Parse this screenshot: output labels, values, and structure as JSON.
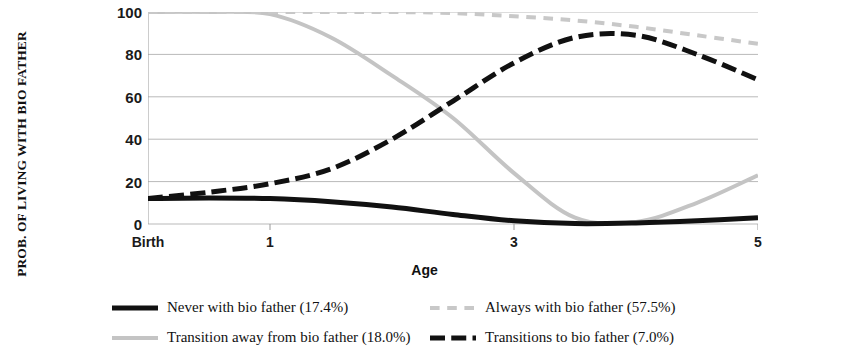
{
  "chart_data": {
    "type": "line",
    "title": "",
    "xlabel": "Age",
    "ylabel": "PROB. OF LIVING WITH BIO FATHER",
    "xlim": [
      0,
      5
    ],
    "ylim": [
      0,
      100
    ],
    "yticks": [
      100,
      80,
      60,
      40,
      20,
      0
    ],
    "xticks": [
      {
        "value": 0,
        "label": "Birth"
      },
      {
        "value": 1,
        "label": "1"
      },
      {
        "value": 3,
        "label": "3"
      },
      {
        "value": 5,
        "label": "5"
      }
    ],
    "grid": true,
    "legend_position": "bottom",
    "x": [
      0,
      0.5,
      1,
      1.5,
      2,
      2.5,
      3,
      3.5,
      4,
      4.5,
      5
    ],
    "series": [
      {
        "name": "Never with bio father (17.4%)",
        "label": "Never with bio father (17.4%)",
        "percent": "17.4%",
        "style": "solid",
        "color": "#111111",
        "width": 5,
        "values": [
          12,
          12.3,
          12,
          10.5,
          8,
          4.5,
          1.5,
          0.2,
          0.5,
          1.5,
          3
        ]
      },
      {
        "name": "Always with bio father (57.5%)",
        "label": "Always with bio father (57.5%)",
        "percent": "57.5%",
        "style": "dotted",
        "color": "#c8c8c8",
        "width": 4,
        "values": [
          100,
          100,
          100,
          100,
          100,
          99.5,
          98,
          96,
          93,
          89,
          85
        ]
      },
      {
        "name": "Transition away from bio father (18.0%)",
        "label": "Transition away from bio father (18.0%)",
        "percent": "18.0%",
        "style": "solid",
        "color": "#c4c4c4",
        "width": 4,
        "values": [
          100,
          100,
          99,
          88,
          70,
          50,
          24,
          3,
          1,
          10,
          23
        ]
      },
      {
        "name": "Transitions to bio father (7.0%)",
        "label": "Transitions to bio father (7.0%)",
        "percent": "7.0%",
        "style": "dashed",
        "color": "#111111",
        "width": 5,
        "values": [
          12,
          15,
          19,
          26,
          40,
          58,
          76,
          88,
          89,
          80,
          68
        ]
      }
    ]
  }
}
